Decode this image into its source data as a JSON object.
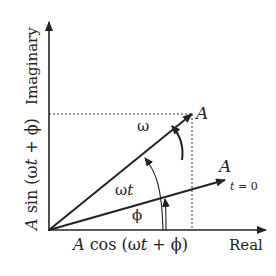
{
  "diagram": {
    "axes": {
      "x_label": "Real",
      "y_label": "Imaginary"
    },
    "vectors": [
      {
        "label": "A",
        "description": "rotating phasor at time t"
      },
      {
        "label": "A",
        "sublabel": "t = 0",
        "description": "phasor at t = 0"
      }
    ],
    "angles": {
      "omega": "ω",
      "omega_t": "ωt",
      "phi": "ϕ"
    },
    "projections": {
      "horizontal": {
        "prefix": "A",
        "text": " cos (ωt + ϕ)"
      },
      "vertical": {
        "prefix": "A",
        "text": " sin (ωt + ϕ)"
      }
    },
    "colors": {
      "line": "#222222",
      "background": "#ffffff"
    }
  }
}
